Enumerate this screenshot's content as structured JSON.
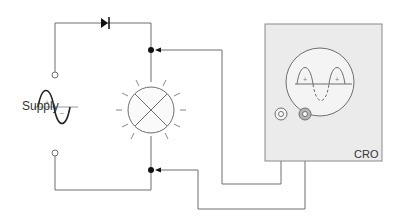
{
  "labels": {
    "supply": "Supply",
    "cro": "CRO",
    "plus": "+",
    "minus": "–"
  },
  "colors": {
    "wire": "#6e6e6e",
    "cro_panel": "#ebebeb",
    "cro_border": "#8a8a8a",
    "terminal_fill": "#b5b5b5",
    "junction": "#111111",
    "background": "#ffffff"
  },
  "components": [
    {
      "name": "ac-supply",
      "label": "Supply"
    },
    {
      "name": "diode"
    },
    {
      "name": "lamp"
    },
    {
      "name": "cro",
      "label": "CRO",
      "screen_trace": "half-wave rectified (positive half-cycles solid, negative dashed)"
    }
  ]
}
